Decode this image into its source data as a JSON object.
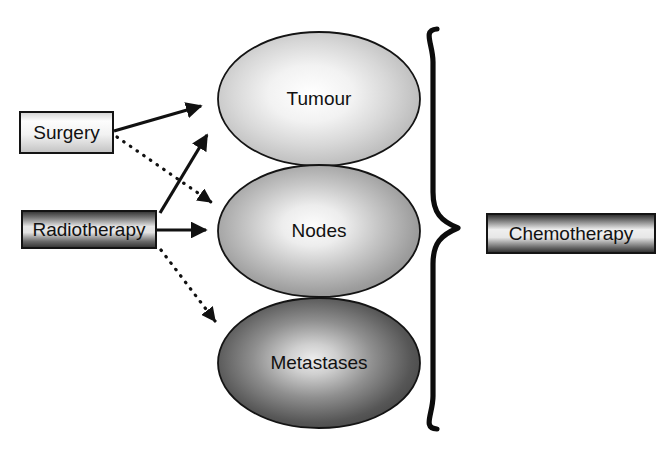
{
  "diagram": {
    "background_color": "#ffffff",
    "outline_color": "#141414",
    "text_color": "#111111",
    "treatments": [
      {
        "id": "surgery",
        "label": "Surgery",
        "style": "light-gradient-box",
        "fill_light": "#ffffff",
        "fill_dark": "#c9c9c9",
        "x": 20,
        "y": 112,
        "width": 93,
        "height": 41
      },
      {
        "id": "radiotherapy",
        "label": "Radiotherapy",
        "style": "dark-gradient-box",
        "fill_light": "#e8e8e8",
        "fill_dark": "#3a3a3a",
        "x": 22,
        "y": 211,
        "width": 134,
        "height": 37
      },
      {
        "id": "chemotherapy",
        "label": "Chemotherapy",
        "style": "dark-gradient-box",
        "fill_light": "#f0f0f0",
        "fill_dark": "#2e2e2e",
        "x": 487,
        "y": 214,
        "width": 168,
        "height": 39
      }
    ],
    "targets": [
      {
        "id": "tumour",
        "label": "Tumour",
        "cx": 319,
        "cy": 99,
        "rx": 101,
        "ry": 67,
        "fill_center": "#ffffff",
        "fill_edge": "#b4b4b4"
      },
      {
        "id": "nodes",
        "label": "Nodes",
        "cx": 319,
        "cy": 231,
        "rx": 101,
        "ry": 66,
        "fill_center": "#fbfbfb",
        "fill_edge": "#8c8c8c"
      },
      {
        "id": "metastases",
        "label": "Metastases",
        "cx": 319,
        "cy": 363,
        "rx": 101,
        "ry": 65,
        "fill_center": "#e0e0e0",
        "fill_edge": "#3c3c3c"
      }
    ],
    "connections": [
      {
        "id": "surgery-to-tumour",
        "from": "surgery",
        "to": "tumour",
        "line_style": "solid",
        "arrowhead": "filled-triangle",
        "x1": 114,
        "y1": 131,
        "x2": 207,
        "y2": 104
      },
      {
        "id": "surgery-to-nodes",
        "from": "surgery",
        "to": "nodes",
        "line_style": "dotted",
        "arrowhead": "filled-triangle",
        "x1": 116,
        "y1": 136,
        "x2": 217,
        "y2": 206
      },
      {
        "id": "radiotherapy-to-tumour",
        "from": "radiotherapy",
        "to": "tumour",
        "line_style": "solid",
        "arrowhead": "filled-triangle",
        "x1": 160,
        "y1": 213,
        "x2": 212,
        "y2": 129
      },
      {
        "id": "radiotherapy-to-nodes",
        "from": "radiotherapy",
        "to": "nodes",
        "line_style": "solid",
        "arrowhead": "filled-triangle",
        "x1": 158,
        "y1": 230,
        "x2": 213,
        "y2": 230
      },
      {
        "id": "radiotherapy-to-metastases",
        "from": "radiotherapy",
        "to": "metastases",
        "line_style": "dotted",
        "arrowhead": "filled-triangle",
        "x1": 160,
        "y1": 249,
        "x2": 221,
        "y2": 327
      }
    ],
    "brace": {
      "id": "grouping-brace",
      "orientation": "right-pointing",
      "top_y": 28,
      "bottom_y": 430,
      "tip_x": 461,
      "spine_x": 433,
      "stroke_width": 5,
      "groups": [
        "tumour",
        "nodes",
        "metastases"
      ],
      "leads_to": "chemotherapy"
    }
  }
}
